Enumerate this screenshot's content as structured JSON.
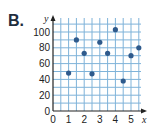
{
  "problem_label": "B.",
  "chart_data": {
    "type": "scatter",
    "title": "",
    "xlabel": "x",
    "ylabel": "y",
    "xlim": [
      0,
      5.5
    ],
    "ylim": [
      0,
      105
    ],
    "x_ticks": [
      0,
      1,
      2,
      3,
      4,
      5
    ],
    "y_ticks": [
      0,
      20,
      40,
      60,
      80,
      100
    ],
    "grid": true,
    "points": [
      {
        "x": 1,
        "y": 48
      },
      {
        "x": 1.5,
        "y": 90
      },
      {
        "x": 2,
        "y": 73
      },
      {
        "x": 2.5,
        "y": 47
      },
      {
        "x": 3,
        "y": 87
      },
      {
        "x": 3.5,
        "y": 73
      },
      {
        "x": 4,
        "y": 103
      },
      {
        "x": 4.5,
        "y": 38
      },
      {
        "x": 5,
        "y": 70
      },
      {
        "x": 5.5,
        "y": 80
      }
    ],
    "colors": {
      "grid": "#7fb3d9",
      "point": "#2f5a8c",
      "axis": "#222222"
    }
  }
}
